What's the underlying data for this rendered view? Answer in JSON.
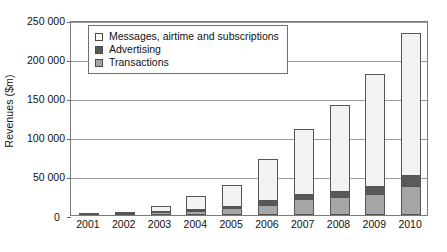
{
  "chart_data": {
    "type": "bar",
    "stacked": true,
    "title": "",
    "xlabel": "",
    "ylabel": "Revenues ($m)",
    "ylim": [
      0,
      250000
    ],
    "ytick_values": [
      0,
      50000,
      100000,
      150000,
      200000,
      250000
    ],
    "ytick_labels": [
      "0",
      "50 000",
      "100 000",
      "150 000",
      "200 000",
      "250 000"
    ],
    "grid": true,
    "legend_position": "top-left-inside",
    "categories": [
      "2001",
      "2002",
      "2003",
      "2004",
      "2005",
      "2006",
      "2007",
      "2008",
      "2009",
      "2010"
    ],
    "series": [
      {
        "name": "Transactions",
        "color": "#a6a6a6",
        "values": [
          300,
          900,
          3500,
          5500,
          8500,
          12500,
          20000,
          22500,
          27000,
          37000
        ]
      },
      {
        "name": "Advertising",
        "color": "#595959",
        "values": [
          100,
          400,
          1000,
          1500,
          2000,
          5000,
          5500,
          7500,
          9500,
          13500
        ]
      },
      {
        "name": "Messages, airtime and subscriptions",
        "color": "#f2f2f2",
        "values": [
          200,
          900,
          7500,
          18000,
          28500,
          54000,
          84500,
          111000,
          144000,
          183500
        ]
      }
    ],
    "totals": [
      600,
      2200,
      12000,
      25000,
      39000,
      71500,
      110000,
      141000,
      180500,
      234000
    ]
  },
  "legend": {
    "items": [
      {
        "label": "Messages, airtime and subscriptions",
        "swatch": "legend-swatch-messages",
        "color": "#ffffff"
      },
      {
        "label": "Advertising",
        "swatch": "legend-swatch-advertising",
        "color": "#595959"
      },
      {
        "label": "Transactions",
        "swatch": "legend-swatch-transactions",
        "color": "#a6a6a6"
      }
    ]
  }
}
